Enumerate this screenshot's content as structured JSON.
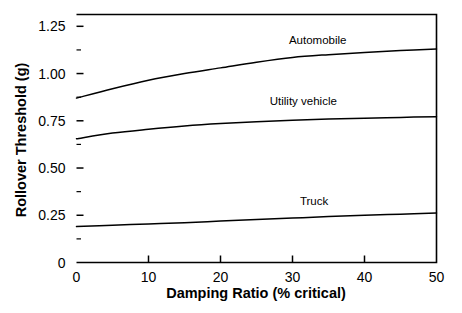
{
  "chart_data": {
    "type": "line",
    "title": "",
    "xlabel": "Damping Ratio (% critical)",
    "ylabel": "Rollover Threshold  (g)",
    "xlim": [
      0,
      50
    ],
    "ylim": [
      0,
      1.3125
    ],
    "grid": false,
    "legend_position": "inline-labels",
    "x_ticks": [
      0,
      10,
      20,
      30,
      40,
      50
    ],
    "x_tick_labels": [
      "0",
      "10",
      "20",
      "30",
      "40",
      "50"
    ],
    "y_ticks": [
      0,
      0.25,
      0.5,
      0.75,
      1.0,
      1.25
    ],
    "y_tick_labels": [
      "0",
      "0.25",
      "0.50",
      "0.75",
      "1.00",
      "1.25"
    ],
    "y_minor_ticks": [
      0.125,
      0.375,
      0.625,
      0.875,
      1.125
    ],
    "x": [
      0,
      5,
      10,
      15,
      20,
      25,
      30,
      35,
      40,
      45,
      50
    ],
    "series": [
      {
        "name": "Automobile",
        "values": [
          0.87,
          0.92,
          0.965,
          1.0,
          1.03,
          1.06,
          1.085,
          1.1,
          1.112,
          1.122,
          1.13
        ]
      },
      {
        "name": "Utility vehicle",
        "values": [
          0.655,
          0.685,
          0.705,
          0.722,
          0.735,
          0.745,
          0.753,
          0.759,
          0.764,
          0.768,
          0.772
        ]
      },
      {
        "name": "Truck",
        "values": [
          0.19,
          0.197,
          0.204,
          0.211,
          0.219,
          0.227,
          0.235,
          0.243,
          0.25,
          0.256,
          0.262
        ]
      }
    ],
    "annotations": [
      {
        "text": "Automobile",
        "x": 33.5,
        "y": 1.155
      },
      {
        "text": "Utility vehicle",
        "x": 31.5,
        "y": 0.835
      },
      {
        "text": "Truck",
        "x": 33.0,
        "y": 0.305
      }
    ],
    "colors": {
      "line": "#000000",
      "axis": "#000000",
      "background": "#ffffff"
    }
  }
}
